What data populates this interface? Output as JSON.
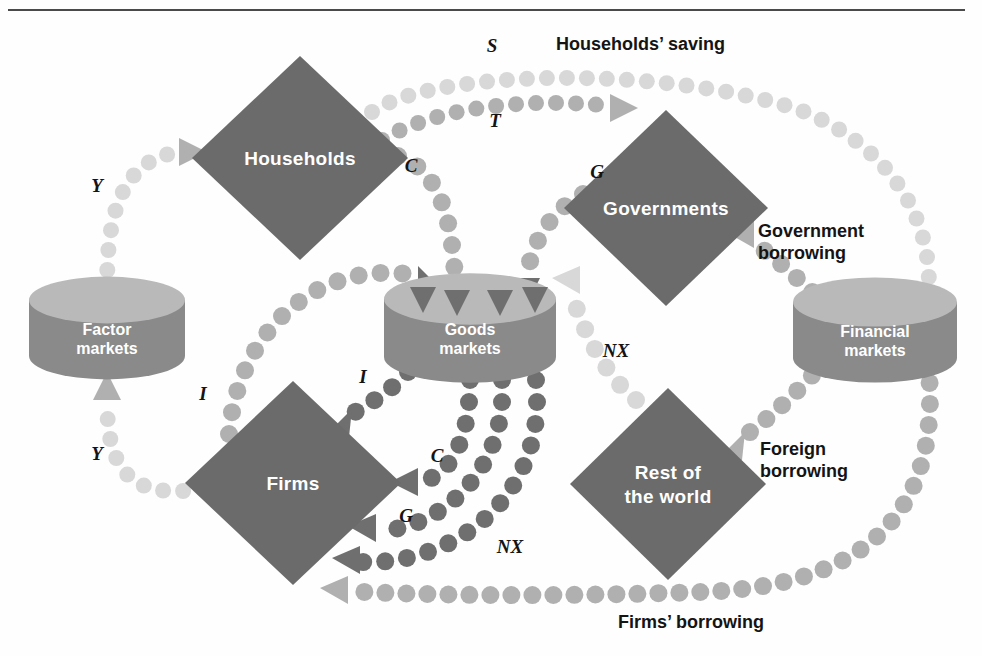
{
  "figure": {
    "kind": "circular-flow-diagram",
    "width": 982,
    "height": 656,
    "background": "#fefefe",
    "rule_color": "#4a4a4a"
  },
  "palette": {
    "diamond_fill": "#6b6b6b",
    "cylinder_top": "#b9b9b9",
    "cylinder_body": "#8a8a8a",
    "dot_light": "#d8d8d8",
    "dot_mid": "#b0b0b0",
    "dot_dark": "#8f8f8f",
    "dot_darkest": "#6f6f6f",
    "text_dark": "#141414",
    "text_light": "#ffffff"
  },
  "nodes": {
    "diamonds": [
      {
        "id": "households",
        "label": "Households",
        "cx": 300,
        "cy": 158,
        "rx": 108,
        "ry": 102,
        "lines": [
          "Households"
        ]
      },
      {
        "id": "governments",
        "label": "Governments",
        "cx": 666,
        "cy": 208,
        "rx": 102,
        "ry": 98,
        "lines": [
          "Governments"
        ]
      },
      {
        "id": "firms",
        "label": "Firms",
        "cx": 293,
        "cy": 483,
        "rx": 108,
        "ry": 102,
        "lines": [
          "Firms"
        ]
      },
      {
        "id": "rest-of-world",
        "label": "Rest of the world",
        "cx": 668,
        "cy": 484,
        "rx": 98,
        "ry": 96,
        "lines": [
          "Rest of",
          "the world"
        ]
      }
    ],
    "cylinders": [
      {
        "id": "factor-markets",
        "label": "Factor markets",
        "cx": 107,
        "cy": 328,
        "rx": 78,
        "h": 56,
        "lines": [
          "Factor",
          "markets"
        ]
      },
      {
        "id": "goods-markets",
        "label": "Goods markets",
        "cx": 470,
        "cy": 328,
        "rx": 86,
        "h": 58,
        "lines": [
          "Goods",
          "markets"
        ]
      },
      {
        "id": "financial-markets",
        "label": "Financial markets",
        "cx": 875,
        "cy": 330,
        "rx": 82,
        "h": 56,
        "lines": [
          "Financial",
          "markets"
        ]
      }
    ]
  },
  "flow_tags": [
    {
      "id": "tag-y-top",
      "text": "Y",
      "x": 97,
      "y": 192
    },
    {
      "id": "tag-y-bottom",
      "text": "Y",
      "x": 97,
      "y": 460
    },
    {
      "id": "tag-s",
      "text": "S",
      "x": 492,
      "y": 52
    },
    {
      "id": "tag-t",
      "text": "T",
      "x": 495,
      "y": 127
    },
    {
      "id": "tag-c-top",
      "text": "C",
      "x": 411,
      "y": 172
    },
    {
      "id": "tag-g-top",
      "text": "G",
      "x": 597,
      "y": 178
    },
    {
      "id": "tag-nx-mid",
      "text": "NX",
      "x": 616,
      "y": 357
    },
    {
      "id": "tag-i-left",
      "text": "I",
      "x": 203,
      "y": 400
    },
    {
      "id": "tag-i-right",
      "text": "I",
      "x": 363,
      "y": 383
    },
    {
      "id": "tag-c-bottom",
      "text": "C",
      "x": 437,
      "y": 462
    },
    {
      "id": "tag-g-bottom",
      "text": "G",
      "x": 406,
      "y": 522
    },
    {
      "id": "tag-nx-bottom",
      "text": "NX",
      "x": 510,
      "y": 553
    }
  ],
  "flow_captions": [
    {
      "id": "caption-households-saving",
      "text": "Households’ saving",
      "x": 556,
      "y": 50,
      "lines": [
        "Households’ saving"
      ]
    },
    {
      "id": "caption-government-borrowing",
      "text": "Government borrowing",
      "x": 758,
      "y": 237,
      "lines": [
        "Government",
        "borrowing"
      ]
    },
    {
      "id": "caption-foreign-borrowing",
      "text": "Foreign borrowing",
      "x": 760,
      "y": 455,
      "lines": [
        "Foreign",
        "borrowing"
      ]
    },
    {
      "id": "caption-firms-borrowing",
      "text": "Firms’ borrowing",
      "x": 618,
      "y": 628,
      "lines": [
        "Firms’ borrowing"
      ]
    }
  ],
  "flows": [
    {
      "id": "flow-y-to-households",
      "tag": "Y",
      "from": "factor-markets",
      "to": "households",
      "shade": "dot_light",
      "r": 8,
      "spacing": 20,
      "path": "M 107 290 C 107 240 110 160 180 152",
      "arrow": {
        "x": 193,
        "y": 152,
        "dir": "right",
        "shade": "dot_mid"
      }
    },
    {
      "id": "flow-y-to-factor-markets",
      "tag": "Y",
      "from": "firms",
      "to": "factor-markets",
      "shade": "dot_light",
      "r": 8,
      "spacing": 20,
      "path": "M 203 489 C 130 500 107 470 107 400",
      "arrow": {
        "x": 107,
        "y": 386,
        "dir": "up",
        "shade": "dot_mid"
      }
    },
    {
      "id": "flow-s-households-to-financial",
      "tag": "S",
      "from": "households",
      "to": "financial-markets",
      "shade": "dot_light",
      "r": 8,
      "spacing": 20,
      "path": "M 372 112 C 430 70 660 64 800 110 C 900 150 935 230 928 300",
      "arrow": {
        "x": 925,
        "y": 312,
        "dir": "down",
        "shade": "dot_light"
      }
    },
    {
      "id": "flow-t-households-to-governments",
      "tag": "T",
      "from": "households",
      "to": "governments",
      "shade": "dot_mid",
      "r": 8,
      "spacing": 20,
      "path": "M 382 140 C 440 104 540 98 610 106",
      "arrow": {
        "x": 624,
        "y": 108,
        "dir": "right",
        "shade": "dot_mid"
      }
    },
    {
      "id": "flow-c-households-to-goods",
      "tag": "C",
      "from": "households",
      "to": "goods-markets",
      "shade": "dot_mid",
      "r": 9,
      "spacing": 22,
      "path": "M 398 156 C 440 170 452 220 455 278",
      "arrow": {
        "x": 456,
        "y": 292,
        "dir": "down",
        "shade": "dot_darkest"
      }
    },
    {
      "id": "flow-g-governments-to-goods",
      "tag": "G",
      "from": "governments",
      "to": "goods-markets",
      "shade": "dot_mid",
      "r": 9,
      "spacing": 22,
      "path": "M 583 194 C 548 212 530 248 527 278",
      "arrow": {
        "x": 526,
        "y": 292,
        "dir": "down",
        "shade": "dot_darkest"
      }
    },
    {
      "id": "flow-nx-world-to-goods",
      "tag": "NX",
      "from": "rest-of-world",
      "to": "goods-markets",
      "shade": "dot_light",
      "r": 9,
      "spacing": 22,
      "path": "M 636 400 C 600 370 584 330 570 290",
      "arrow": {
        "x": 566,
        "y": 280,
        "dir": "up-left",
        "shade": "dot_light"
      }
    },
    {
      "id": "flow-i-financial-to-goods",
      "tag": "I",
      "from": "factor-markets",
      "to": "goods-markets",
      "shade": "dot_mid",
      "r": 9,
      "spacing": 22,
      "path": "M 229 434 C 238 330 320 256 420 276",
      "arrow": {
        "x": 432,
        "y": 280,
        "dir": "down-right",
        "shade": "dot_darkest"
      }
    },
    {
      "id": "flow-i-goods-to-firms",
      "tag": "I",
      "from": "goods-markets",
      "to": "firms",
      "shade": "dot_darkest",
      "r": 9,
      "spacing": 22,
      "path": "M 408 372 C 392 390 370 404 348 416",
      "arrow": {
        "x": 338,
        "y": 423,
        "dir": "down-left",
        "shade": "dot_darkest"
      }
    },
    {
      "id": "flow-c-goods-to-firms",
      "tag": "C",
      "from": "goods-markets",
      "to": "firms",
      "shade": "dot_darkest",
      "r": 9,
      "spacing": 22,
      "path": "M 470 380 C 470 440 450 478 418 482",
      "arrow": {
        "x": 404,
        "y": 482,
        "dir": "left",
        "shade": "dot_darkest"
      }
    },
    {
      "id": "flow-g-goods-to-firms",
      "tag": "G",
      "from": "goods-markets",
      "to": "firms",
      "shade": "dot_darkest",
      "r": 9,
      "spacing": 22,
      "path": "M 502 380 C 508 470 440 530 376 531",
      "arrow": {
        "x": 362,
        "y": 528,
        "dir": "up-left",
        "shade": "dot_darkest"
      }
    },
    {
      "id": "flow-nx-goods-to-firms",
      "tag": "NX",
      "from": "goods-markets",
      "to": "firms",
      "shade": "dot_darkest",
      "r": 9,
      "spacing": 22,
      "path": "M 536 380 C 548 500 450 566 360 562",
      "arrow": {
        "x": 346,
        "y": 560,
        "dir": "up-left",
        "shade": "dot_darkest"
      }
    },
    {
      "id": "flow-government-borrowing",
      "tag": "Government borrowing",
      "from": "financial-markets",
      "to": "governments",
      "shade": "dot_mid",
      "r": 9,
      "spacing": 21,
      "path": "M 828 306 C 800 282 780 260 752 242",
      "arrow": {
        "x": 740,
        "y": 234,
        "dir": "up-left",
        "shade": "dot_mid"
      }
    },
    {
      "id": "flow-foreign-borrowing",
      "tag": "Foreign borrowing",
      "from": "financial-markets",
      "to": "rest-of-world",
      "shade": "dot_mid",
      "r": 9,
      "spacing": 21,
      "path": "M 826 360 C 800 390 770 418 742 438",
      "arrow": {
        "x": 731,
        "y": 446,
        "dir": "down-left",
        "shade": "dot_mid"
      }
    },
    {
      "id": "flow-firms-borrowing",
      "tag": "Firms’ borrowing",
      "from": "financial-markets",
      "to": "firms",
      "shade": "dot_mid",
      "r": 9,
      "spacing": 21,
      "path": "M 928 362 C 940 480 900 586 700 592 C 520 598 400 594 348 591",
      "arrow": {
        "x": 334,
        "y": 590,
        "dir": "up-left",
        "shade": "dot_mid"
      }
    }
  ],
  "cylinder_inflow_arrows": [
    {
      "id": "goods-arrow-i",
      "x": 423,
      "y": 300,
      "shade": "dot_darkest"
    },
    {
      "id": "goods-arrow-c",
      "x": 457,
      "y": 303,
      "shade": "dot_darkest"
    },
    {
      "id": "goods-arrow-g",
      "x": 500,
      "y": 303,
      "shade": "dot_darkest"
    },
    {
      "id": "goods-arrow-nx",
      "x": 535,
      "y": 300,
      "shade": "dot_darkest"
    }
  ]
}
